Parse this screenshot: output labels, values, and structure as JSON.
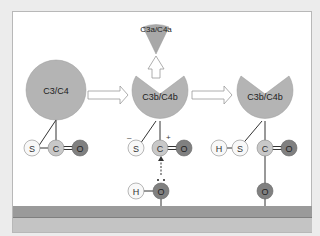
{
  "diagram": {
    "molecules": {
      "reactant": {
        "label": "C3/C4"
      },
      "fragment": {
        "label": "C3a/C4a"
      },
      "intermediate": {
        "label": "C3b/C4b"
      },
      "product": {
        "label": "C3b/C4b"
      }
    },
    "atoms": {
      "sulfur": "S",
      "carbon": "C",
      "oxygen": "O",
      "hydrogen": "H"
    },
    "charges": {
      "negative": "–",
      "positive": "+"
    },
    "colors": {
      "protein_fill": "#b4b4b4",
      "atom_light": "#f8f8f8",
      "atom_mid": "#c8c8c8",
      "atom_dark": "#808080",
      "membrane_top": "#9a9a9a",
      "membrane_bottom": "#c4c4c4",
      "background": "#ececec"
    }
  }
}
